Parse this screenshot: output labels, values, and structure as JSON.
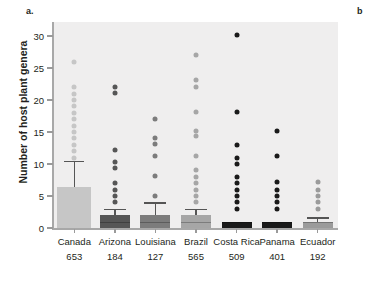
{
  "figure": {
    "panel_a_label": "a.",
    "panel_b_label": "b"
  },
  "chart_data": {
    "type": "box",
    "title": "",
    "xlabel": "",
    "ylabel": "Number of host plant genera",
    "ylim": [
      0,
      31
    ],
    "yticks": [
      0,
      5,
      10,
      15,
      20,
      25,
      30
    ],
    "ytick_labels": [
      "0",
      "5",
      "10",
      "15",
      "20",
      "25",
      "30"
    ],
    "grid": false,
    "legend": "none",
    "categories": [
      "Canada",
      "Arizona",
      "Louisiana",
      "Brazil",
      "Costa Rica",
      "Panama",
      "Ecuador"
    ],
    "sample_sizes": [
      653,
      184,
      127,
      565,
      509,
      401,
      192
    ],
    "sample_size_labels": [
      "653",
      "184",
      "127",
      "565",
      "509",
      "401",
      "192"
    ],
    "series": [
      {
        "name": "Canada",
        "n": 653,
        "color": "#c6c6c6",
        "q1": 0,
        "median": 1,
        "q3": 6.4,
        "whisker_low": 0,
        "whisker_high": 10.5,
        "outliers": [
          11,
          12,
          13,
          14,
          15,
          16,
          17,
          18,
          19,
          20,
          21,
          22,
          26
        ]
      },
      {
        "name": "Arizona",
        "n": 184,
        "color": "#565656",
        "q1": 0,
        "median": 1,
        "q3": 2,
        "whisker_low": 0,
        "whisker_high": 3,
        "outliers": [
          4,
          5,
          6,
          7,
          9.4,
          10.3,
          12.2,
          21.1,
          22.1
        ]
      },
      {
        "name": "Louisiana",
        "n": 127,
        "color": "#7c7c7c",
        "q1": 0,
        "median": 1,
        "q3": 2,
        "whisker_low": 0,
        "whisker_high": 4,
        "outliers": [
          5,
          8.2,
          11.2,
          13.1,
          14.1,
          17.1
        ]
      },
      {
        "name": "Brazil",
        "n": 565,
        "color": "#a6a6a6",
        "q1": 0,
        "median": 1,
        "q3": 2,
        "whisker_low": 0,
        "whisker_high": 3,
        "outliers": [
          4,
          5,
          6,
          7,
          8,
          9,
          11.2,
          14.3,
          15.1,
          18.2,
          22.1,
          23.1,
          27
        ]
      },
      {
        "name": "Costa Rica",
        "n": 509,
        "color": "#1a1a1a",
        "q1": 0,
        "median": 1,
        "q3": 1,
        "whisker_low": 0,
        "whisker_high": 1,
        "outliers": [
          3,
          4,
          5,
          6,
          7,
          8,
          10,
          11,
          13,
          18.1,
          30.1
        ]
      },
      {
        "name": "Panama",
        "n": 401,
        "color": "#1a1a1a",
        "q1": 0,
        "median": 1,
        "q3": 1,
        "whisker_low": 0,
        "whisker_high": 1,
        "outliers": [
          3,
          4,
          5,
          6,
          7.2,
          11.2,
          15.1
        ]
      },
      {
        "name": "Ecuador",
        "n": 192,
        "color": "#9b9b9b",
        "q1": 0,
        "median": 1,
        "q3": 1,
        "whisker_low": 0,
        "whisker_high": 1.7,
        "outliers": [
          3,
          4,
          5,
          6,
          7.2
        ]
      }
    ]
  },
  "colors": {
    "plot_background": "#efeeee",
    "axis": "#a8a8a8",
    "text": "#231f20"
  }
}
